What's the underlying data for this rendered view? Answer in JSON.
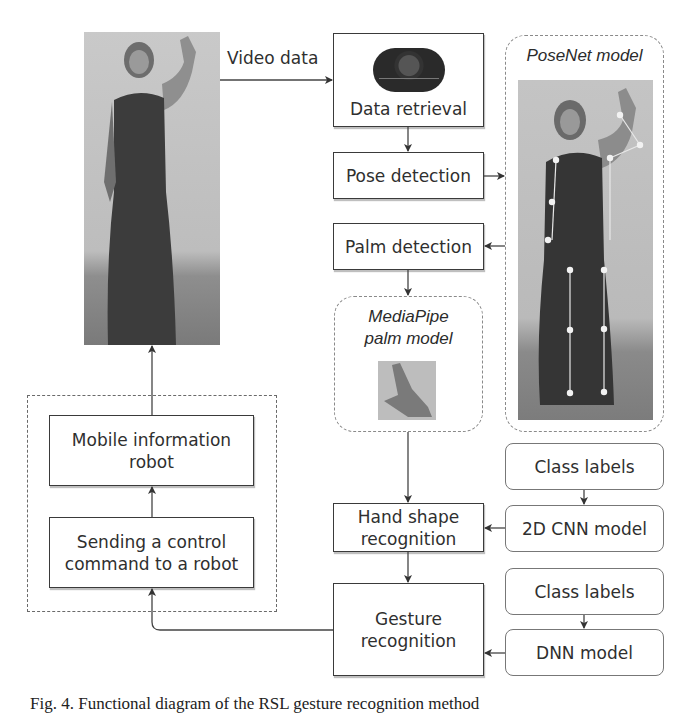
{
  "diagram": {
    "input_label": "Video data",
    "nodes": {
      "data_retrieval": "Data retrieval",
      "pose_detection": "Pose detection",
      "palm_detection": "Palm detection",
      "hand_shape_recognition_line1": "Hand shape",
      "hand_shape_recognition_line2": "recognition",
      "gesture_recognition_line1": "Gesture",
      "gesture_recognition_line2": "recognition",
      "mobile_robot_line1": "Mobile information",
      "mobile_robot_line2": "robot",
      "send_command_line1": "Sending a control",
      "send_command_line2": "command to a robot",
      "class_labels_1": "Class labels",
      "cnn_model": "2D CNN model",
      "class_labels_2": "Class labels",
      "dnn_model": "DNN model"
    },
    "models": {
      "posenet_title": "PoseNet model",
      "mediapipe_title_line1": "MediaPipe",
      "mediapipe_title_line2": "palm model"
    },
    "icons": {
      "camera": "webcam-icon",
      "person_photo": "person-photo",
      "hand_photo": "hand-photo"
    }
  },
  "caption": "Fig. 4. Functional diagram of the RSL gesture recognition method"
}
